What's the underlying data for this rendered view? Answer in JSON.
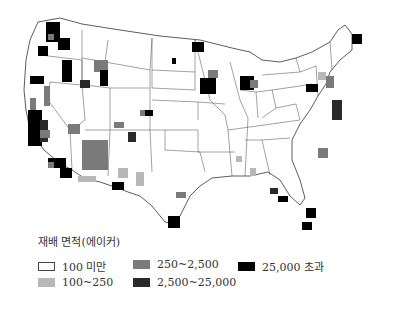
{
  "map": {
    "subject": "United States county map",
    "colors": {
      "lt100": "#ffffff",
      "100_250": "#b8b8b8",
      "250_2500": "#7a7a7a",
      "2500_25000": "#2a2a2a",
      "gt25000": "#000000",
      "border": "#333333"
    }
  },
  "legend": {
    "title": "재배 면적(에이커)",
    "items": [
      {
        "label": "100 미만",
        "color": "#ffffff",
        "outline": true
      },
      {
        "label": "100~250",
        "color": "#b8b8b8"
      },
      {
        "label": "250~2,500",
        "color": "#7a7a7a"
      },
      {
        "label": "2,500~25,000",
        "color": "#2a2a2a"
      },
      {
        "label": "25,000 초과",
        "color": "#000000"
      }
    ]
  }
}
